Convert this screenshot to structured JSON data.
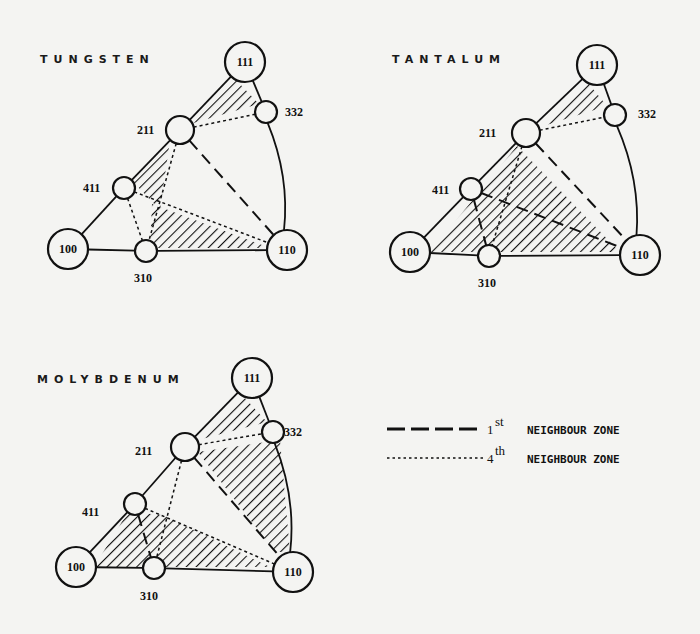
{
  "figure": {
    "background": "#f4f4f2",
    "ink": "#111111"
  },
  "panels": [
    {
      "id": "tungsten",
      "title": "TUNGSTEN",
      "title_pos": [
        40,
        63
      ],
      "nodes": [
        {
          "id": "111",
          "label": "111",
          "x": 245,
          "y": 62,
          "r": 20,
          "label_inside": true
        },
        {
          "id": "332",
          "label": "332",
          "x": 266,
          "y": 112,
          "r": 11,
          "label_inside": false,
          "lx": 285,
          "ly": 116
        },
        {
          "id": "211",
          "label": "211",
          "x": 180,
          "y": 130,
          "r": 14,
          "label_inside": false,
          "lx": 137,
          "ly": 134
        },
        {
          "id": "411",
          "label": "411",
          "x": 124,
          "y": 188,
          "r": 11,
          "label_inside": false,
          "lx": 83,
          "ly": 192
        },
        {
          "id": "100",
          "label": "100",
          "x": 68,
          "y": 249,
          "r": 20,
          "label_inside": true
        },
        {
          "id": "310",
          "label": "310",
          "x": 146,
          "y": 251,
          "r": 11,
          "label_inside": false,
          "lx": 134,
          "ly": 282
        },
        {
          "id": "110",
          "label": "110",
          "x": 287,
          "y": 250,
          "r": 20,
          "label_inside": true
        }
      ],
      "solid_edges": [
        [
          "111",
          "211"
        ],
        [
          "211",
          "411"
        ],
        [
          "411",
          "100"
        ],
        [
          "100",
          "310"
        ],
        [
          "310",
          "110"
        ],
        [
          "111",
          "332"
        ]
      ],
      "arc_edges": [
        [
          "332",
          "110"
        ]
      ],
      "hatched_regions": [
        [
          "111",
          "332",
          "211"
        ],
        [
          "211",
          "411",
          "p:142,198"
        ],
        [
          "p:150,240",
          "p:152,205",
          "110"
        ]
      ],
      "hatch_poly_points": [
        [
          [
            236,
            80
          ],
          [
            259,
            104
          ],
          [
            190,
            124
          ]
        ],
        [
          [
            170,
            140
          ],
          [
            133,
            182
          ],
          [
            160,
            210
          ]
        ],
        [
          [
            152,
            204
          ],
          [
            150,
            248
          ],
          [
            270,
            248
          ]
        ]
      ],
      "dashed_edges": [
        [
          "211",
          "110"
        ]
      ],
      "dotted_edges": [
        [
          "411",
          "310"
        ],
        [
          "411",
          "110"
        ],
        [
          "211",
          "310"
        ],
        [
          "211",
          "332"
        ]
      ]
    },
    {
      "id": "tantalum",
      "title": "TANTALUM",
      "title_pos": [
        392,
        63
      ],
      "nodes": [
        {
          "id": "111",
          "label": "111",
          "x": 597,
          "y": 65,
          "r": 20,
          "label_inside": true
        },
        {
          "id": "332",
          "label": "332",
          "x": 615,
          "y": 115,
          "r": 11,
          "label_inside": false,
          "lx": 638,
          "ly": 118
        },
        {
          "id": "211",
          "label": "211",
          "x": 526,
          "y": 133,
          "r": 14,
          "label_inside": false,
          "lx": 479,
          "ly": 137
        },
        {
          "id": "411",
          "label": "411",
          "x": 471,
          "y": 189,
          "r": 11,
          "label_inside": false,
          "lx": 432,
          "ly": 194
        },
        {
          "id": "100",
          "label": "100",
          "x": 410,
          "y": 252,
          "r": 20,
          "label_inside": true
        },
        {
          "id": "310",
          "label": "310",
          "x": 489,
          "y": 256,
          "r": 11,
          "label_inside": false,
          "lx": 478,
          "ly": 287
        },
        {
          "id": "110",
          "label": "110",
          "x": 640,
          "y": 255,
          "r": 20,
          "label_inside": true
        }
      ],
      "solid_edges": [
        [
          "111",
          "211"
        ],
        [
          "211",
          "411"
        ],
        [
          "411",
          "100"
        ],
        [
          "100",
          "310"
        ],
        [
          "310",
          "110"
        ],
        [
          "111",
          "332"
        ]
      ],
      "arc_edges": [
        [
          "332",
          "110"
        ]
      ],
      "hatch_poly_points": [
        [
          [
            588,
            83
          ],
          [
            607,
            106
          ],
          [
            540,
            127
          ]
        ],
        [
          [
            517,
            146
          ],
          [
            430,
            252
          ],
          [
            620,
            252
          ]
        ]
      ],
      "dashed_edges": [
        [
          "211",
          "110"
        ],
        [
          "411",
          "110"
        ],
        [
          "411",
          "310"
        ]
      ],
      "dotted_edges": [
        [
          "211",
          "332"
        ],
        [
          "211",
          "310"
        ]
      ]
    },
    {
      "id": "molybdenum",
      "title": "MOLYBDENUM",
      "title_pos": [
        37,
        383
      ],
      "nodes": [
        {
          "id": "111",
          "label": "111",
          "x": 252,
          "y": 378,
          "r": 20,
          "label_inside": true
        },
        {
          "id": "332",
          "label": "332",
          "x": 273,
          "y": 432,
          "r": 11,
          "label_inside": false,
          "lx": 284,
          "ly": 436
        },
        {
          "id": "211",
          "label": "211",
          "x": 185,
          "y": 447,
          "r": 14,
          "label_inside": false,
          "lx": 135,
          "ly": 455
        },
        {
          "id": "411",
          "label": "411",
          "x": 135,
          "y": 504,
          "r": 11,
          "label_inside": false,
          "lx": 82,
          "ly": 516
        },
        {
          "id": "100",
          "label": "100",
          "x": 76,
          "y": 567,
          "r": 20,
          "label_inside": true
        },
        {
          "id": "310",
          "label": "310",
          "x": 154,
          "y": 568,
          "r": 11,
          "label_inside": false,
          "lx": 140,
          "ly": 600
        },
        {
          "id": "110",
          "label": "110",
          "x": 293,
          "y": 572,
          "r": 20,
          "label_inside": true
        }
      ],
      "solid_edges": [
        [
          "111",
          "211"
        ],
        [
          "211",
          "411"
        ],
        [
          "411",
          "100"
        ],
        [
          "100",
          "310"
        ],
        [
          "310",
          "110"
        ],
        [
          "111",
          "332"
        ]
      ],
      "arc_edges": [
        [
          "332",
          "110"
        ]
      ],
      "hatch_poly_points": [
        [
          [
            243,
            396
          ],
          [
            267,
            422
          ],
          [
            198,
            440
          ]
        ],
        [
          [
            198,
            452
          ],
          [
            280,
            440
          ],
          [
            290,
            552
          ],
          [
            275,
            552
          ]
        ],
        [
          [
            128,
            512
          ],
          [
            94,
            567
          ],
          [
            270,
            567
          ],
          [
            163,
            515
          ]
        ]
      ],
      "dashed_edges": [
        [
          "211",
          "110"
        ],
        [
          "411",
          "310"
        ]
      ],
      "dotted_edges": [
        [
          "211",
          "332"
        ],
        [
          "211",
          "310"
        ],
        [
          "411",
          "110"
        ]
      ]
    }
  ],
  "legend": {
    "items": [
      {
        "style": "dashed",
        "x1": 387,
        "x2": 483,
        "y": 429,
        "ordinal": "1",
        "suffix": "st",
        "text": "NEIGHBOUR ZONE"
      },
      {
        "style": "dotted",
        "x1": 387,
        "x2": 483,
        "y": 458,
        "ordinal": "4",
        "suffix": "th",
        "text": "NEIGHBOUR ZONE"
      }
    ]
  }
}
